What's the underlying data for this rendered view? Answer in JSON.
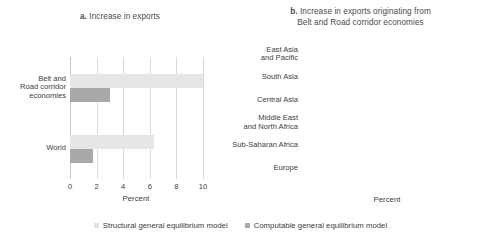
{
  "figure": {
    "legend": {
      "position": "bottom-center",
      "entries": [
        {
          "label": "Structural general equilibrium model",
          "color": "#e6e6e6",
          "key": "structural"
        },
        {
          "label": "Computable general equilibrium model",
          "color": "#a9a9a9",
          "key": "computable"
        }
      ]
    }
  },
  "chart_data": [
    {
      "type": "bar",
      "orientation": "horizontal",
      "panel": "a",
      "panel_prefix": "a.",
      "title": "Increase in exports",
      "title_lines": [
        "Increase in exports"
      ],
      "xlabel": "Percent",
      "ylabel": "",
      "xlim": [
        0,
        10
      ],
      "xticks": [
        0,
        2,
        4,
        6,
        8,
        10
      ],
      "xtick_labels": [
        "0",
        "2",
        "4",
        "6",
        "8",
        "10"
      ],
      "grid": true,
      "categories": [
        "Belt and Road corridor economies",
        "World"
      ],
      "category_lines": [
        [
          "Belt and",
          "Road corridor",
          "economies"
        ],
        [
          "World"
        ]
      ],
      "series": [
        {
          "name": "Structural general equilibrium model",
          "color": "#e6e6e6",
          "values": [
            10.0,
            6.3
          ]
        },
        {
          "name": "Computable general equilibrium model",
          "color": "#a9a9a9",
          "values": [
            3.0,
            1.7
          ]
        }
      ]
    },
    {
      "type": "bar",
      "orientation": "horizontal",
      "panel": "b",
      "panel_prefix": "b.",
      "title": "Increase in exports originating from Belt and Road corridor economies",
      "title_lines": [
        "Increase in exports originating from",
        "Belt and Road corridor economies"
      ],
      "xlabel": "Percent",
      "ylabel": "",
      "xlim": [
        0,
        4
      ],
      "xticks": [
        0,
        0.5,
        1,
        1.5,
        2,
        2.5,
        3,
        3.5,
        4
      ],
      "xtick_labels": [
        "0",
        "0.5",
        "1",
        "1.5",
        "2",
        "2.5",
        "3",
        "3.5",
        "4"
      ],
      "grid": true,
      "categories": [
        "East Asia and Pacific",
        "South Asia",
        "Central Asia",
        "Middle East and North Africa",
        "Sub-Saharan Africa",
        "Europe"
      ],
      "category_lines": [
        [
          "East Asia",
          "and Pacific"
        ],
        [
          "South Asia"
        ],
        [
          "Central Asia"
        ],
        [
          "Middle East",
          "and North Africa"
        ],
        [
          "Sub-Saharan Africa"
        ],
        [
          "Europe"
        ]
      ],
      "series": [
        {
          "name": "Computable general equilibrium model",
          "color": "#a9a9a9",
          "values": [
            3.73,
            3.65,
            1.93,
            1.5,
            1.25,
            1.05
          ]
        }
      ]
    }
  ]
}
